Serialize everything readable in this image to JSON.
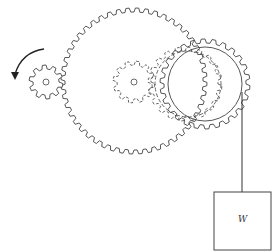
{
  "diagram": {
    "weight_label": "W",
    "rotation_arrow": "counterclockwise",
    "colors": {
      "stroke": "#444444",
      "background": "#ffffff"
    },
    "gears": [
      {
        "name": "driver-gear",
        "cx": 46,
        "cy": 82,
        "r_outer": 17,
        "r_inner": 13,
        "teeth": 10,
        "hub_r": 3
      },
      {
        "name": "large-gear",
        "cx": 134,
        "cy": 81,
        "r_outer": 73,
        "r_inner": 69,
        "teeth": 48
      },
      {
        "name": "center-pinion",
        "cx": 134,
        "cy": 82,
        "r_outer": 21,
        "r_inner": 17,
        "teeth": 12,
        "hub_r": 3
      },
      {
        "name": "right-gear",
        "cx": 205,
        "cy": 84,
        "r_outer": 45,
        "r_inner": 41,
        "teeth": 26
      },
      {
        "name": "hidden-gear",
        "cx": 185,
        "cy": 84,
        "r_outer": 37,
        "r_inner": 33,
        "teeth": 20
      }
    ]
  }
}
